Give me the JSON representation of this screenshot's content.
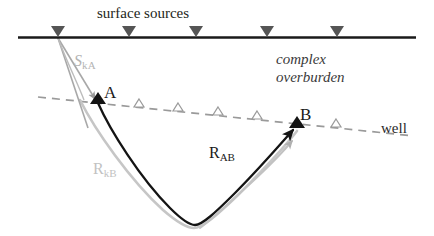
{
  "figure": {
    "type": "seismic-raypath-diagram",
    "width": 434,
    "height": 236,
    "background": "#ffffff"
  },
  "labels": {
    "surface_sources": "surface sources",
    "complex": "complex",
    "overburden": "overburden",
    "well": "well",
    "point_a": "A",
    "point_b": "B",
    "ray_skA_main": "S",
    "ray_skA_sub": "kA",
    "ray_RkB_main": "R",
    "ray_RkB_sub": "kB",
    "ray_RAB_main": "R",
    "ray_RAB_sub": "AB"
  },
  "colors": {
    "surface_line": "#1a1a1a",
    "source_marker": "#4d4d4d",
    "well_line": "#9a9a9a",
    "well_marker_stroke": "#9a9a9a",
    "receiver_marker_fill": "#1a1a1a",
    "ray_black": "#141414",
    "ray_gray": "#bdbdbd",
    "ray_gray_mid": "#9a9a9a",
    "text_dark": "#231f20",
    "text_gray": "#b4b4b4",
    "text_overburden": "#3a3a3a"
  },
  "geometry": {
    "surface_line": {
      "x1": 18,
      "y1": 37.5,
      "x2": 416,
      "y2": 37.5,
      "stroke_width": 2.6
    },
    "source_markers": [
      {
        "x": 58,
        "y": 37
      },
      {
        "x": 129,
        "y": 37
      },
      {
        "x": 196,
        "y": 37
      },
      {
        "x": 267,
        "y": 37
      },
      {
        "x": 337,
        "y": 37
      }
    ],
    "source_marker_size": {
      "half_width": 7,
      "height": 11
    },
    "well_line": {
      "x1": 38,
      "y1": 97,
      "x2": 414,
      "y2": 136,
      "dash": "8 6",
      "stroke_width": 1.7
    },
    "well_markers": [
      {
        "x": 139,
        "y": 107
      },
      {
        "x": 178,
        "y": 111
      },
      {
        "x": 218,
        "y": 115
      },
      {
        "x": 257,
        "y": 119
      },
      {
        "x": 336,
        "y": 127
      }
    ],
    "well_marker_size": {
      "half_width": 5,
      "height": 8
    },
    "point_a": {
      "x": 98,
      "y": 102
    },
    "point_b": {
      "x": 297,
      "y": 126
    },
    "receiver_marker_size": {
      "half_width": 8,
      "height": 11
    },
    "ray_black_path": "M 98 103 C 110 130, 140 178, 170 208 C 182 220, 190 225, 195 225 C 202 225, 215 213, 235 193 C 258 170, 280 146, 296 128",
    "ray_gray_RkB_path": "M 80 100 C 95 130, 130 180, 163 210 C 178 223, 188 228, 194 228 C 202 228, 216 216, 237 196 C 260 173, 283 149, 297 131",
    "ray_gray_skA_main": "M 58 38 L 96 100",
    "ray_gray_skA_second": "M 58 38 L 85 118",
    "ray_gray_skA_arrow_tip": {
      "x": 97,
      "y": 101
    },
    "ray_RAB_arrow_tip": {
      "x": 294,
      "y": 129
    }
  }
}
